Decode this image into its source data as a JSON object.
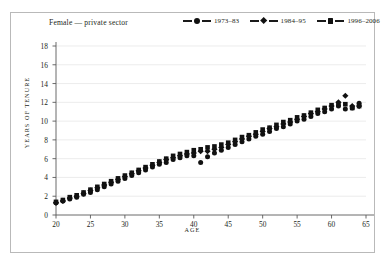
{
  "figure": {
    "title": "Female — private sector",
    "border_color": "#b9b9b9",
    "background": "#ffffff"
  },
  "legend": {
    "position": "top-right",
    "items": [
      {
        "label": "1973–83",
        "marker": "circle",
        "color": "#111111"
      },
      {
        "label": "1984–95",
        "marker": "diamond",
        "color": "#111111"
      },
      {
        "label": "1996–2006",
        "marker": "square",
        "color": "#111111"
      }
    ]
  },
  "chart_data": {
    "type": "scatter",
    "title": "Female — private sector",
    "xlabel": "AGE",
    "ylabel": "YEARS OF TENURE",
    "xlim": [
      20,
      65
    ],
    "ylim": [
      0,
      18
    ],
    "xticks": [
      20,
      25,
      30,
      35,
      40,
      45,
      50,
      55,
      60,
      65
    ],
    "yticks": [
      0,
      2,
      4,
      6,
      8,
      10,
      12,
      14,
      16,
      18
    ],
    "grid": "horizontal",
    "legend_position": "top-right",
    "x": [
      20,
      21,
      22,
      23,
      24,
      25,
      26,
      27,
      28,
      29,
      30,
      31,
      32,
      33,
      34,
      35,
      36,
      37,
      38,
      39,
      40,
      41,
      42,
      43,
      44,
      45,
      46,
      47,
      48,
      49,
      50,
      51,
      52,
      53,
      54,
      55,
      56,
      57,
      58,
      59,
      60,
      61,
      62,
      63,
      64
    ],
    "series": [
      {
        "name": "1973–83",
        "marker": "circle",
        "color": "#111111",
        "values": [
          1.3,
          1.5,
          1.7,
          1.9,
          2.2,
          2.4,
          2.7,
          3.0,
          3.3,
          3.6,
          3.9,
          4.2,
          4.5,
          4.8,
          5.1,
          5.4,
          5.6,
          5.9,
          6.1,
          6.3,
          6.3,
          5.6,
          6.2,
          6.6,
          6.9,
          7.2,
          7.5,
          7.8,
          8.1,
          8.4,
          8.6,
          8.9,
          9.2,
          9.4,
          9.7,
          10.0,
          10.2,
          10.5,
          10.8,
          11.0,
          11.3,
          11.6,
          11.3,
          11.4,
          11.9
        ]
      },
      {
        "name": "1984–95",
        "marker": "diamond",
        "color": "#111111",
        "values": [
          1.3,
          1.5,
          1.8,
          2.0,
          2.3,
          2.6,
          2.9,
          3.2,
          3.5,
          3.8,
          4.1,
          4.4,
          4.7,
          5.0,
          5.3,
          5.6,
          5.9,
          6.1,
          6.3,
          6.5,
          6.6,
          6.8,
          6.8,
          7.0,
          7.2,
          7.5,
          7.8,
          8.1,
          8.4,
          8.6,
          8.9,
          9.2,
          9.4,
          9.7,
          9.9,
          10.2,
          10.5,
          10.8,
          11.0,
          11.3,
          11.6,
          12.0,
          12.7,
          11.6,
          11.6
        ]
      },
      {
        "name": "1996–2006",
        "marker": "square",
        "color": "#111111",
        "values": [
          1.4,
          1.6,
          1.9,
          2.1,
          2.4,
          2.7,
          3.0,
          3.3,
          3.6,
          3.9,
          4.2,
          4.5,
          4.8,
          5.1,
          5.4,
          5.7,
          6.0,
          6.3,
          6.5,
          6.7,
          6.9,
          7.0,
          7.2,
          7.3,
          7.5,
          7.7,
          8.0,
          8.3,
          8.5,
          8.8,
          9.1,
          9.3,
          9.6,
          9.9,
          10.1,
          10.4,
          10.6,
          10.9,
          11.2,
          11.4,
          11.7,
          11.8,
          11.8,
          11.4,
          11.6
        ]
      }
    ]
  }
}
